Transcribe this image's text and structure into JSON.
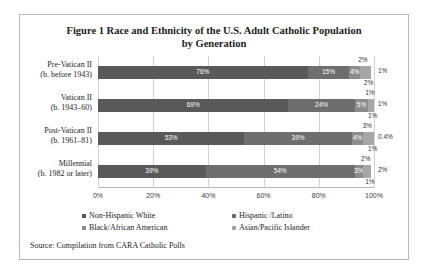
{
  "page_header": "",
  "figure": {
    "title_line1": "Figure 1 Race and Ethnicity of the U.S. Adult Catholic Population",
    "title_line2": "by Generation",
    "source": "Source: Compilation from CARA Catholic Polls"
  },
  "legend": {
    "items": [
      {
        "label": "Non-Hispanic White",
        "color": "#595959"
      },
      {
        "label": "Hispanic /Latino",
        "color": "#6e6e6e"
      },
      {
        "label": "Black/African American",
        "color": "#8c8c8c"
      },
      {
        "label": "Asian/Pacific Islander",
        "color": "#a6a6a6"
      }
    ]
  },
  "chart_data": {
    "type": "bar",
    "orientation": "horizontal",
    "stacked": true,
    "title": "Figure 1 Race and Ethnicity of the U.S. Adult Catholic Population by Generation",
    "xlabel": "",
    "ylabel": "",
    "xlim": [
      0,
      100
    ],
    "xticks": [
      "0%",
      "20%",
      "40%",
      "60%",
      "80%",
      "100%"
    ],
    "xtick_values": [
      0,
      20,
      40,
      60,
      80,
      100
    ],
    "grid": true,
    "legend_position": "bottom",
    "categories": [
      {
        "line1": "Pre-Vatican II",
        "line2": "(b. before 1943)"
      },
      {
        "line1": "Vatican II",
        "line2": "(b. 1943–60)"
      },
      {
        "line1": "Post-Vatican II",
        "line2": "(b. 1961–81)"
      },
      {
        "line1": "Millennial",
        "line2": "(b. 1982 or later)"
      }
    ],
    "series": [
      {
        "name": "Non-Hispanic White",
        "values": [
          76,
          69,
          53,
          39
        ]
      },
      {
        "name": "Hispanic /Latino",
        "values": [
          15,
          24,
          39,
          54
        ]
      },
      {
        "name": "Black/African American",
        "values": [
          4,
          5,
          4,
          3
        ]
      },
      {
        "name": "Asian/Pacific Islander",
        "values": [
          2,
          1,
          3,
          2
        ]
      }
    ],
    "rows": [
      {
        "segments": [
          {
            "value": 76,
            "label": "76%",
            "placement": "inside"
          },
          {
            "value": 15,
            "label": "15%",
            "placement": "inside"
          },
          {
            "value": 4,
            "label": "4%",
            "placement": "inside"
          },
          {
            "value": 2,
            "label": "2%",
            "placement": "above"
          },
          {
            "value": 2,
            "label": "2%",
            "placement": "below"
          },
          {
            "value": 1,
            "label": "1%",
            "placement": "right"
          }
        ]
      },
      {
        "segments": [
          {
            "value": 69,
            "label": "69%",
            "placement": "inside"
          },
          {
            "value": 24,
            "label": "24%",
            "placement": "inside"
          },
          {
            "value": 5,
            "label": "5%",
            "placement": "inside"
          },
          {
            "value": 1,
            "label": "1%",
            "placement": "above"
          },
          {
            "value": 1,
            "label": "1%",
            "placement": "below"
          },
          {
            "value": 1,
            "label": "1%",
            "placement": "right"
          }
        ]
      },
      {
        "segments": [
          {
            "value": 53,
            "label": "53%",
            "placement": "inside"
          },
          {
            "value": 39,
            "label": "39%",
            "placement": "inside"
          },
          {
            "value": 4,
            "label": "4%",
            "placement": "inside"
          },
          {
            "value": 3,
            "label": "3%",
            "placement": "above"
          },
          {
            "value": 1,
            "label": "1%",
            "placement": "below"
          },
          {
            "value": 0.4,
            "label": "0.4%",
            "placement": "right"
          }
        ]
      },
      {
        "segments": [
          {
            "value": 39,
            "label": "39%",
            "placement": "inside"
          },
          {
            "value": 54,
            "label": "54%",
            "placement": "inside"
          },
          {
            "value": 3,
            "label": "3%",
            "placement": "inside"
          },
          {
            "value": 2,
            "label": "2%",
            "placement": "above"
          },
          {
            "value": 1,
            "label": "1%",
            "placement": "below"
          },
          {
            "value": 2,
            "label": "2%",
            "placement": "right"
          }
        ]
      }
    ]
  }
}
